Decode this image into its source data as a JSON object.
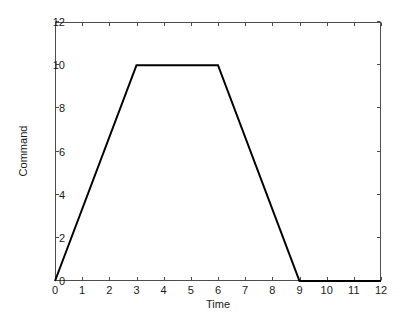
{
  "chart_data": {
    "type": "line",
    "title": "",
    "subtitle": "",
    "xlabel": "Time",
    "ylabel": "Command",
    "xlim": [
      0,
      12
    ],
    "ylim": [
      0,
      12
    ],
    "xticks": [
      0,
      1,
      2,
      3,
      4,
      5,
      6,
      7,
      8,
      9,
      10,
      11,
      12
    ],
    "xtick_labels": [
      "0",
      "1",
      "2",
      "3",
      "4",
      "5",
      "6",
      "7",
      "8",
      "9",
      "10",
      "11",
      "12"
    ],
    "yticks": [
      0,
      2,
      4,
      6,
      8,
      10,
      12
    ],
    "ytick_labels": [
      "0",
      "2",
      "4",
      "6",
      "8",
      "10",
      "12"
    ],
    "grid": false,
    "legend": null,
    "legend_position": "none",
    "tick_direction": "in",
    "box": true,
    "series": [
      {
        "name": "Command",
        "color": "#000000",
        "line_width": 2,
        "x": [
          0,
          3,
          6,
          9,
          12
        ],
        "y": [
          0,
          10,
          10,
          0,
          0
        ],
        "points": [
          {
            "x": 0,
            "y": 0
          },
          {
            "x": 3,
            "y": 10
          },
          {
            "x": 6,
            "y": 10
          },
          {
            "x": 9,
            "y": 0
          },
          {
            "x": 12,
            "y": 0
          }
        ]
      }
    ],
    "annotations": []
  },
  "figure": {
    "background_color": "#ffffff",
    "axis_color": "#4d4d4d",
    "text_color": "#1a1a1a"
  }
}
